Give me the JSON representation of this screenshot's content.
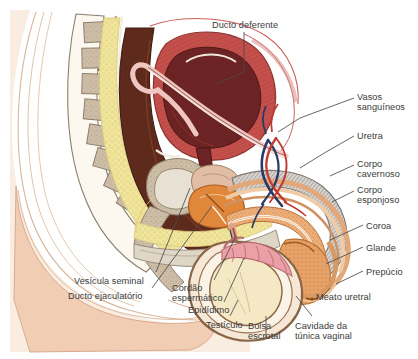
{
  "figure": {
    "language": "pt-BR",
    "background_color": "#ffffff",
    "label_color": "#3b3b3b",
    "leader_line_color": "#4a4a4a"
  },
  "labels": [
    {
      "id": "ducto-deferente",
      "text": "Ducto deferente",
      "x": 212,
      "y": 20,
      "align": "left"
    },
    {
      "id": "vasos-sanguineos",
      "text": "Vasos\nsanguíneos",
      "x": 357,
      "y": 92,
      "align": "left"
    },
    {
      "id": "uretra",
      "text": "Uretra",
      "x": 357,
      "y": 131,
      "align": "left"
    },
    {
      "id": "corpo-cavernoso",
      "text": "Corpo\ncavernoso",
      "x": 357,
      "y": 159,
      "align": "left"
    },
    {
      "id": "corpo-esponjoso",
      "text": "Corpo\nesponjoso",
      "x": 357,
      "y": 185,
      "align": "left"
    },
    {
      "id": "coroa",
      "text": "Coroa",
      "x": 366,
      "y": 221,
      "align": "left"
    },
    {
      "id": "glande",
      "text": "Glande",
      "x": 366,
      "y": 243,
      "align": "left"
    },
    {
      "id": "prepucio",
      "text": "Prepúcio",
      "x": 366,
      "y": 267,
      "align": "left"
    },
    {
      "id": "meato-uretral",
      "text": "Meato uretral",
      "x": 316,
      "y": 292,
      "align": "left"
    },
    {
      "id": "cavidade-tunica",
      "text": "Cavidade da\ntúnica vaginal",
      "x": 295,
      "y": 321,
      "align": "left"
    },
    {
      "id": "bolsa-escrotal",
      "text": "Bolsa\nescrotal",
      "x": 248,
      "y": 321,
      "align": "left"
    },
    {
      "id": "testiculo",
      "text": "Testículo",
      "x": 206,
      "y": 320,
      "align": "left"
    },
    {
      "id": "epididimo",
      "text": "Epidídimo",
      "x": 188,
      "y": 305,
      "align": "left"
    },
    {
      "id": "cordao-espermatico",
      "text": "Cordão\nespermático",
      "x": 172,
      "y": 283,
      "align": "left"
    },
    {
      "id": "vesicula-seminal",
      "text": "Vesícula seminal",
      "x": 74,
      "y": 276,
      "align": "left"
    },
    {
      "id": "ducto-ejaculatorio",
      "text": "Ducto ejaculatório",
      "x": 68,
      "y": 291,
      "align": "left"
    }
  ],
  "palette": {
    "skin_outer": "#f3d2bc",
    "skin_mid": "#f6ddc9",
    "skin_light": "#faeade",
    "fat_yellow": "#f2e59c",
    "fat_yellow_light": "#f7efbe",
    "bone_tan": "#cdbda6",
    "bone_outline": "#8c7f6d",
    "cavity_dark": "#5e2a1c",
    "cavity_mid": "#6e3124",
    "muscle_red": "#c44a47",
    "muscle_pink": "#d98d88",
    "bladder_dark": "#6b2423",
    "orange_urethra": "#e0873c",
    "orange_light": "#eeac6b",
    "glans_orange": "#e59a5e",
    "testis_cream": "#f4e9c4",
    "epididymis_pink": "#eaa0a6",
    "artery_red": "#c03a32",
    "vein_navy": "#2b3a63",
    "outline": "#6b5c4c"
  }
}
